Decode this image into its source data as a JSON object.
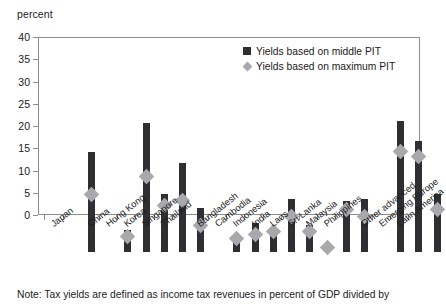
{
  "chart_data": {
    "type": "bar",
    "title": "",
    "subtitle": "",
    "xlabel": "",
    "ylabel": "percent",
    "ylim": [
      0,
      40
    ],
    "ytick_labels": [
      "40",
      "35",
      "30",
      "25",
      "20",
      "15",
      "10",
      "5",
      "0"
    ],
    "ytick_values": [
      40,
      35,
      30,
      25,
      20,
      15,
      10,
      5,
      0
    ],
    "grid": false,
    "legend_position": "top-right",
    "legend": [
      "Yields based on middle PIT",
      "Yields based on maximum PIT"
    ],
    "categories": [
      "Japan",
      "China",
      "Hong Kong",
      "Korea",
      "Singapore",
      "Thailand",
      "Bangladesh",
      "Cambodia",
      "Indonesia",
      "India",
      "Laos",
      "Sri Lanka",
      "Malaysia",
      "Philippines",
      "Other advanced",
      "Emerging Europe",
      "Latin America"
    ],
    "series": [
      {
        "name": "Yields based on middle PIT",
        "type": "bar",
        "color": "#2f2f33",
        "values": [
          22.5,
          5.0,
          29.0,
          13.0,
          20.0,
          10.0,
          4.0,
          6.5,
          5.5,
          12.0,
          6.0,
          1.8,
          11.5,
          12.0,
          29.5,
          25.0,
          13.0
        ]
      },
      {
        "name": "Yields based on maximum PIT",
        "type": "marker-diamond",
        "color": "#a9a9ad",
        "values": [
          13.0,
          3.5,
          17.0,
          10.5,
          11.5,
          6.0,
          3.0,
          4.0,
          4.5,
          8.0,
          4.5,
          1.0,
          9.5,
          8.0,
          22.5,
          21.5,
          9.5
        ]
      }
    ],
    "category_groups": [
      {
        "label": "group-1",
        "members": [
          "Japan"
        ]
      },
      {
        "label": "group-2",
        "members": [
          "China",
          "Hong Kong",
          "Korea",
          "Singapore",
          "Thailand"
        ]
      },
      {
        "label": "group-3",
        "members": [
          "Bangladesh",
          "Cambodia",
          "Indonesia",
          "India",
          "Laos",
          "Sri Lanka",
          "Malaysia",
          "Philippines"
        ]
      },
      {
        "label": "group-4",
        "members": [
          "Other advanced",
          "Emerging Europe",
          "Latin America"
        ]
      }
    ]
  },
  "note": {
    "text": "Note: Tax yields are defined as income tax revenues in percent of GDP divided by"
  }
}
